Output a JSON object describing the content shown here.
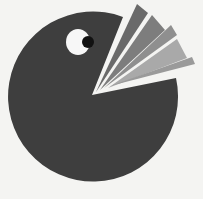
{
  "illustration": {
    "subject": "pie-chart pac-man eating its own slices",
    "colors": {
      "background": "#f4f4f2",
      "body": "#3e3e3e",
      "eye_white": "#f7f7f7",
      "pupil": "#111111",
      "slice_1": "#6a6a6a",
      "slice_2": "#7d7d7d",
      "slice_3": "#8f8f8f",
      "slice_4": "#a9a9a9",
      "slice_5": "#9a9a9a"
    }
  }
}
